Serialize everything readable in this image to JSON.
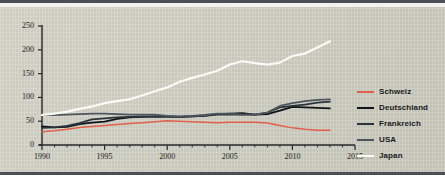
{
  "chart_data": {
    "type": "line",
    "title": "",
    "subtitle": "",
    "xlabel": "",
    "ylabel": "",
    "xlim": [
      1990,
      2015
    ],
    "ylim": [
      0,
      250
    ],
    "grid": false,
    "legend_position": "right",
    "x_ticks": [
      "1990",
      "1995",
      "2000",
      "2005",
      "2010",
      "2015"
    ],
    "x_tick_values": [
      1990,
      1995,
      2000,
      2005,
      2010,
      2015
    ],
    "x_minor_tick_step": 1,
    "y_ticks": [
      "0",
      "50",
      "100",
      "150",
      "200",
      "250"
    ],
    "y_tick_values": [
      0,
      50,
      100,
      150,
      200,
      250
    ],
    "x": [
      1990,
      1991,
      1992,
      1993,
      1994,
      1995,
      1996,
      1997,
      1998,
      1999,
      2000,
      2001,
      2002,
      2003,
      2004,
      2005,
      2006,
      2007,
      2008,
      2009,
      2010,
      2011,
      2012,
      2013
    ],
    "series": [
      {
        "name": "Schweiz",
        "color": "#e1604b",
        "values": [
          28,
          30,
          33,
          37,
          39,
          41,
          43,
          45,
          47,
          49,
          51,
          50,
          49,
          48,
          47,
          48,
          48,
          48,
          46,
          41,
          36,
          33,
          31,
          31
        ]
      },
      {
        "name": "Deutschland",
        "color": "#101418",
        "values": [
          39,
          37,
          38,
          44,
          47,
          49,
          55,
          58,
          59,
          60,
          60,
          59,
          60,
          62,
          65,
          66,
          67,
          64,
          65,
          72,
          80,
          79,
          78,
          77
        ]
      },
      {
        "name": "Frankreich",
        "color": "#2b333d",
        "values": [
          36,
          37,
          40,
          46,
          54,
          56,
          58,
          59,
          60,
          59,
          59,
          59,
          60,
          61,
          64,
          64,
          64,
          64,
          68,
          79,
          82,
          85,
          89,
          91
        ]
      },
      {
        "name": "USA",
        "color": "#4d565e",
        "values": [
          63,
          63,
          64,
          65,
          66,
          66,
          65,
          64,
          64,
          64,
          61,
          60,
          61,
          63,
          66,
          66,
          64,
          64,
          68,
          82,
          88,
          92,
          95,
          96
        ]
      },
      {
        "name": "Japan",
        "color": "#fbfaf4",
        "values": [
          63,
          66,
          70,
          76,
          81,
          88,
          92,
          96,
          104,
          113,
          121,
          133,
          141,
          148,
          156,
          169,
          176,
          172,
          169,
          173,
          187,
          192,
          205,
          218
        ]
      }
    ]
  },
  "legend": {
    "items": [
      {
        "label": "Schweiz",
        "color": "#e1604b"
      },
      {
        "label": "Deutschland",
        "color": "#101418"
      },
      {
        "label": "Frankreich",
        "color": "#2b333d"
      },
      {
        "label": "USA",
        "color": "#4d565e"
      },
      {
        "label": "Japan",
        "color": "#fbfaf4"
      }
    ]
  }
}
